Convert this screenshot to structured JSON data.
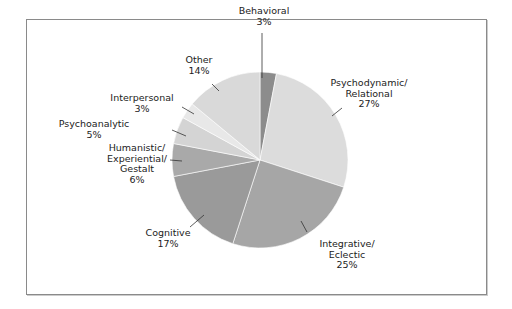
{
  "chart_data": {
    "type": "pie",
    "title": "",
    "start_angle_deg": 0,
    "direction": "clockwise",
    "center": [
      260,
      160
    ],
    "radius": 88,
    "slices": [
      {
        "name": "Behavioral",
        "label_lines": [
          "Behavioral",
          "3%"
        ],
        "value": 3,
        "color": "#8c8c8c",
        "label_pos": [
          264,
          14
        ],
        "leader": [
          [
            262,
            33
          ],
          [
            262,
            78
          ]
        ]
      },
      {
        "name": "Psychodynamic/Relational",
        "label_lines": [
          "Psychodynamic/",
          "Relational",
          "27%"
        ],
        "value": 27,
        "color": "#dcdcdc",
        "label_pos": [
          369,
          86
        ],
        "leader": [
          [
            342,
            108
          ],
          [
            332,
            116
          ]
        ]
      },
      {
        "name": "Integrative/Eclectic",
        "label_lines": [
          "Integrative/",
          "Eclectic",
          "25%"
        ],
        "value": 25,
        "color": "#a6a6a6",
        "label_pos": [
          347,
          247
        ],
        "leader": [
          [
            307,
            232
          ],
          [
            301,
            221
          ]
        ]
      },
      {
        "name": "Cognitive",
        "label_lines": [
          "Cognitive",
          "17%"
        ],
        "value": 17,
        "color": "#9a9a9a",
        "label_pos": [
          168,
          236
        ],
        "leader": [
          [
            190,
            227
          ],
          [
            204,
            215
          ]
        ]
      },
      {
        "name": "Humanistic/Experiential/Gestalt",
        "label_lines": [
          "Humanistic/",
          "Experiential/",
          "Gestalt",
          "6%"
        ],
        "value": 6,
        "color": "#a9a9a9",
        "label_pos": [
          137,
          151
        ],
        "leader": [
          [
            170,
            160
          ],
          [
            182,
            161
          ]
        ]
      },
      {
        "name": "Psychoanalytic",
        "label_lines": [
          "Psychoanalytic",
          "5%"
        ],
        "value": 5,
        "color": "#d4d4d4",
        "label_pos": [
          94,
          127
        ],
        "leader": [
          [
            172,
            130
          ],
          [
            186,
            136
          ]
        ]
      },
      {
        "name": "Interpersonal",
        "label_lines": [
          "Interpersonal",
          "3%"
        ],
        "value": 3,
        "color": "#e8e8e8",
        "label_pos": [
          142,
          101
        ],
        "leader": [
          [
            182,
            107
          ],
          [
            194,
            114
          ]
        ]
      },
      {
        "name": "Other",
        "label_lines": [
          "Other",
          "14%"
        ],
        "value": 14,
        "color": "#d9d9d9",
        "label_pos": [
          199,
          63
        ],
        "leader": [
          [
            212,
            84
          ],
          [
            219,
            91
          ]
        ]
      }
    ],
    "legend": null,
    "xlabel": "",
    "ylabel": ""
  }
}
